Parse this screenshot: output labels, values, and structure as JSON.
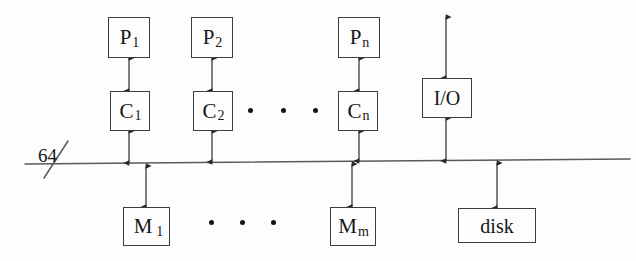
{
  "diagram": {
    "canvas": {
      "width": 636,
      "height": 261
    },
    "colors": {
      "background": "#fdfdfd",
      "stroke": "#3d3d3d",
      "text": "#151515",
      "dot": "#121212"
    },
    "bus": {
      "label": "64",
      "label_x": 38,
      "label_y": 146,
      "x1": 25,
      "y1": 164,
      "x2": 630,
      "y2": 159,
      "slash": {
        "x1": 44,
        "y1": 178,
        "x2": 68,
        "y2": 141
      }
    },
    "processors": [
      {
        "name": "processor-p1",
        "base": "P",
        "sub": "1",
        "x": 108,
        "y": 17,
        "w": 42,
        "h": 41
      },
      {
        "name": "processor-p2",
        "base": "P",
        "sub": "2",
        "x": 191,
        "y": 17,
        "w": 42,
        "h": 41
      },
      {
        "name": "processor-pn",
        "base": "P",
        "sub": "n",
        "x": 338,
        "y": 17,
        "w": 42,
        "h": 41
      }
    ],
    "caches": [
      {
        "name": "cache-c1",
        "base": "C",
        "sub": "1",
        "x": 110,
        "y": 91,
        "w": 40,
        "h": 40
      },
      {
        "name": "cache-c2",
        "base": "C",
        "sub": "2",
        "x": 193,
        "y": 91,
        "w": 40,
        "h": 40
      },
      {
        "name": "cache-cn",
        "base": "C",
        "sub": "n",
        "x": 338,
        "y": 91,
        "w": 40,
        "h": 40
      }
    ],
    "memories": [
      {
        "name": "memory-m1",
        "base": "M",
        "sub": "1",
        "x": 123,
        "y": 207,
        "w": 47,
        "h": 39
      },
      {
        "name": "memory-mm",
        "base": "M",
        "sub": "m",
        "x": 330,
        "y": 207,
        "w": 46,
        "h": 39
      }
    ],
    "io_unit": {
      "name": "io-unit",
      "label": "I/O",
      "x": 422,
      "y": 78,
      "w": 50,
      "h": 40
    },
    "disk_unit": {
      "name": "disk-unit",
      "label": "disk",
      "x": 458,
      "y": 208,
      "w": 78,
      "h": 35
    },
    "ellipsis_top": [
      {
        "cx": 250,
        "cy": 110
      },
      {
        "cx": 283,
        "cy": 110
      },
      {
        "cx": 315,
        "cy": 110
      }
    ],
    "ellipsis_bottom": [
      {
        "cx": 211,
        "cy": 222
      },
      {
        "cx": 242,
        "cy": 222
      },
      {
        "cx": 273,
        "cy": 222
      }
    ],
    "connections": [
      {
        "name": "link-p1-c1",
        "x": 129,
        "y1": 58,
        "y2": 91
      },
      {
        "name": "link-p2-c2",
        "x": 212,
        "y1": 58,
        "y2": 91
      },
      {
        "name": "link-pn-cn",
        "x": 359,
        "y1": 58,
        "y2": 91
      },
      {
        "name": "link-c1-bus",
        "x": 129,
        "y1": 131,
        "y2": 163
      },
      {
        "name": "link-c2-bus",
        "x": 212,
        "y1": 131,
        "y2": 162
      },
      {
        "name": "link-cn-bus",
        "x": 359,
        "y1": 131,
        "y2": 161
      },
      {
        "name": "link-io-top",
        "x": 446,
        "y1": 17,
        "y2": 78
      },
      {
        "name": "link-io-bus",
        "x": 446,
        "y1": 118,
        "y2": 161
      },
      {
        "name": "link-bus-m1",
        "x": 146,
        "y1": 166,
        "y2": 207
      },
      {
        "name": "link-bus-mm",
        "x": 352,
        "y1": 164,
        "y2": 207
      },
      {
        "name": "link-bus-disk",
        "x": 497,
        "y1": 163,
        "y2": 208
      }
    ]
  }
}
